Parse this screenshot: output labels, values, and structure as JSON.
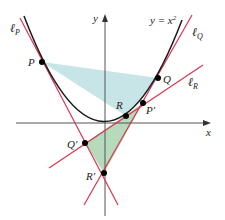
{
  "figure": {
    "curve_label": "y = x",
    "curve_exponent": "2",
    "axes": {
      "x_label": "x",
      "y_label": "y"
    },
    "lines": {
      "P": {
        "label": "ℓ",
        "sub": "P"
      },
      "Q": {
        "label": "ℓ",
        "sub": "Q"
      },
      "R": {
        "label": "ℓ",
        "sub": "R"
      }
    },
    "points": {
      "P": "P",
      "Q": "Q",
      "R": "R",
      "P_prime": "P′",
      "Q_prime": "Q′",
      "R_prime": "R′"
    },
    "colors": {
      "curve": "#1a1a1a",
      "tangent": "#d9344f",
      "axis": "#555555",
      "triangle_upper_fill": "#b9dde0",
      "triangle_lower_fill": "#a9d3b0",
      "point": "#000000"
    }
  }
}
